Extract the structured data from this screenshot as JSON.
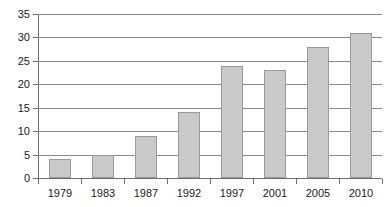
{
  "chart_data": {
    "type": "bar",
    "title": "",
    "subtitle": "",
    "xlabel": "",
    "ylabel": "",
    "categories": [
      "1979",
      "1983",
      "1987",
      "1992",
      "1997",
      "2001",
      "2005",
      "2010"
    ],
    "values": [
      4,
      5,
      9,
      14,
      24,
      23,
      28,
      31
    ],
    "ylim": [
      0,
      35
    ],
    "yticks": [
      0,
      5,
      10,
      15,
      20,
      25,
      30,
      35
    ],
    "ytick_labels": [
      "0",
      "5",
      "10",
      "15",
      "20",
      "25",
      "30",
      "35"
    ],
    "grid": true,
    "grid_axis": "y",
    "legend": false,
    "legend_position": "none",
    "bar_color": "#c9c9c9",
    "bar_edge_color": "#9a9a9a",
    "axis_color": "#6e6e6e",
    "grid_color": "#8a8a8a",
    "background_color": "#ffffff",
    "text_color": "#1a1a1a"
  }
}
